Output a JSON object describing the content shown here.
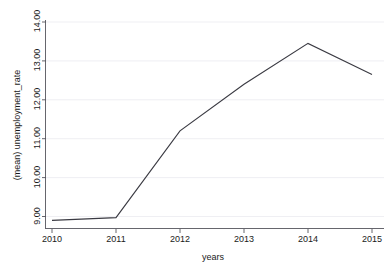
{
  "chart_data": {
    "type": "line",
    "title": "",
    "subtitle": "",
    "xlabel": "years",
    "ylabel": "(mean) unemployment_rate",
    "x": [
      2010,
      2011,
      2012,
      2013,
      2014,
      2015
    ],
    "categories": [
      "2010",
      "2011",
      "2012",
      "2013",
      "2014",
      "2015"
    ],
    "values": [
      8.9,
      8.97,
      11.2,
      12.4,
      13.45,
      12.65
    ],
    "series": [
      {
        "name": "(mean) unemployment_rate",
        "values": [
          8.9,
          8.97,
          11.2,
          12.4,
          13.45,
          12.65
        ]
      }
    ],
    "xlim": [
      2010,
      2015
    ],
    "ylim": [
      8.55,
      14.35
    ],
    "ytick_values": [
      9.0,
      10.0,
      11.0,
      12.0,
      13.0,
      14.0
    ],
    "ytick_labels": [
      "9.00",
      "10.00",
      "11.00",
      "12.00",
      "13.00",
      "14.00"
    ],
    "xtick_values": [
      2010,
      2011,
      2012,
      2013,
      2014,
      2015
    ],
    "xtick_labels": [
      "2010",
      "2011",
      "2012",
      "2013",
      "2014",
      "2015"
    ],
    "grid": "horizontal",
    "legend": "none",
    "line_color": "#3a3a42",
    "grid_color": "#e8e8ee",
    "axis_color": "#55555c",
    "background_color": "#ffffff"
  },
  "labels": {
    "y_axis_title": "(mean) unemployment_rate",
    "x_axis_title": "years",
    "y_tick_9": "9.00",
    "y_tick_10": "10.00",
    "y_tick_11": "11.00",
    "y_tick_12": "12.00",
    "y_tick_13": "13.00",
    "y_tick_14": "14.00",
    "x_tick_2010": "2010",
    "x_tick_2011": "2011",
    "x_tick_2012": "2012",
    "x_tick_2013": "2013",
    "x_tick_2014": "2014",
    "x_tick_2015": "2015"
  }
}
